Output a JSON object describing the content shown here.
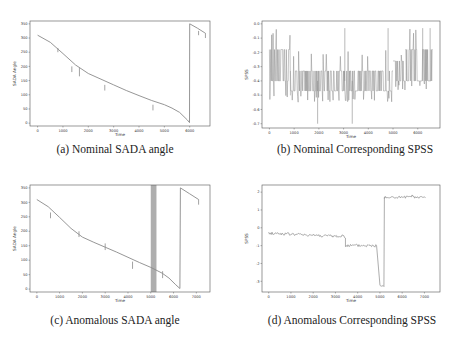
{
  "figure": {
    "panels": [
      {
        "id": "a",
        "caption": "(a) Nominal SADA angle"
      },
      {
        "id": "b",
        "caption": "(b) Nominal Corresponding SPSS"
      },
      {
        "id": "c",
        "caption": "(c) Anomalous SADA angle"
      },
      {
        "id": "d",
        "caption": "(d) Anomalous Corresponding SPSS"
      }
    ]
  },
  "chart_data": [
    {
      "id": "a",
      "type": "line",
      "title": "(a) Nominal SADA angle",
      "xlabel": "Time",
      "ylabel": "SADA Angle",
      "xticks": [
        0,
        1000,
        2000,
        3000,
        4000,
        5000,
        6000
      ],
      "yticks": [
        0,
        50,
        100,
        150,
        200,
        250,
        300,
        350
      ],
      "xlim": [
        -300,
        6800
      ],
      "ylim": [
        -10,
        360
      ],
      "line_color": "#8a8a8a",
      "x": [
        0,
        500,
        1000,
        1500,
        2000,
        2500,
        3000,
        3500,
        4000,
        4500,
        5000,
        5300,
        5600,
        5900,
        5990,
        6000,
        6300,
        6600
      ],
      "y": [
        310,
        285,
        245,
        205,
        175,
        155,
        135,
        115,
        97,
        80,
        65,
        53,
        38,
        12,
        2,
        350,
        335,
        318
      ],
      "spikes": [
        {
          "x": 800,
          "y_from": 250,
          "y_to": 265
        },
        {
          "x": 1350,
          "y_from": 180,
          "y_to": 200
        },
        {
          "x": 1650,
          "y_from": 165,
          "y_to": 195
        },
        {
          "x": 2650,
          "y_from": 115,
          "y_to": 135
        },
        {
          "x": 4550,
          "y_from": 45,
          "y_to": 65
        },
        {
          "x": 6350,
          "y_from": 310,
          "y_to": 325
        },
        {
          "x": 6620,
          "y_from": 300,
          "y_to": 318
        }
      ],
      "grid": false
    },
    {
      "id": "b",
      "type": "line",
      "title": "(b) Nominal Corresponding SPSS",
      "xlabel": "Time",
      "ylabel": "SPSS",
      "xticks": [
        0,
        1000,
        2000,
        3000,
        4000,
        5000,
        6000
      ],
      "yticks": [
        0.0,
        -0.1,
        -0.2,
        -0.3,
        -0.4,
        -0.5,
        -0.6,
        -0.7
      ],
      "xlim": [
        -300,
        6900
      ],
      "ylim": [
        -0.73,
        0.02
      ],
      "line_color": "#8a8a8a",
      "segments": [
        {
          "x_start": 0,
          "x_end": 850,
          "band_low": -0.4,
          "band_high": -0.18,
          "spike_low": -0.55,
          "spike_high": -0.03
        },
        {
          "x_start": 850,
          "x_end": 5000,
          "band_low": -0.47,
          "band_high": -0.33,
          "spike_low": -0.55,
          "spike_high": -0.18
        },
        {
          "x_start": 5000,
          "x_end": 5500,
          "band_low": -0.4,
          "band_high": -0.26,
          "spike_low": -0.47,
          "spike_high": -0.18
        },
        {
          "x_start": 5500,
          "x_end": 6600,
          "band_low": -0.4,
          "band_high": -0.18,
          "spike_low": -0.47,
          "spike_high": -0.03
        }
      ],
      "outliers": [
        {
          "x": 1950,
          "y": -0.7
        },
        {
          "x": 3050,
          "y": -0.03
        },
        {
          "x": 3350,
          "y": -0.7
        },
        {
          "x": 4800,
          "y": -0.03
        },
        {
          "x": 6200,
          "y": -0.03
        },
        {
          "x": 6500,
          "y": -0.03
        }
      ],
      "grid": false
    },
    {
      "id": "c",
      "type": "line",
      "title": "(c) Anomalous SADA angle",
      "xlabel": "Time",
      "ylabel": "SADA Angle",
      "xticks": [
        0,
        1000,
        2000,
        3000,
        4000,
        5000,
        6000,
        7000
      ],
      "yticks": [
        0,
        50,
        100,
        150,
        200,
        250,
        300,
        350
      ],
      "xlim": [
        -300,
        7600
      ],
      "ylim": [
        -10,
        360
      ],
      "line_color": "#8a8a8a",
      "x": [
        0,
        500,
        1000,
        1500,
        2000,
        2500,
        3000,
        3500,
        4000,
        4500,
        5000,
        5500,
        5800,
        6100,
        6280,
        6300,
        6700,
        7100
      ],
      "y": [
        310,
        285,
        248,
        210,
        180,
        162,
        145,
        128,
        110,
        92,
        75,
        55,
        38,
        15,
        2,
        350,
        330,
        310
      ],
      "spikes": [
        {
          "x": 600,
          "y_from": 245,
          "y_to": 265
        },
        {
          "x": 1850,
          "y_from": 180,
          "y_to": 200
        },
        {
          "x": 3000,
          "y_from": 135,
          "y_to": 158
        },
        {
          "x": 4200,
          "y_from": 70,
          "y_to": 95
        },
        {
          "x": 5520,
          "y_from": 38,
          "y_to": 62
        },
        {
          "x": 7100,
          "y_from": 292,
          "y_to": 310
        }
      ],
      "anomaly_region": {
        "x_start": 5000,
        "x_end": 5250,
        "color": "#a0a0a0"
      },
      "grid": false
    },
    {
      "id": "d",
      "type": "line",
      "title": "(d) Anomalous Corresponding SPSS",
      "xlabel": "Time",
      "ylabel": "SPSS",
      "xticks": [
        0,
        1000,
        2000,
        3000,
        4000,
        5000,
        6000,
        7000
      ],
      "yticks": [
        2,
        1,
        0,
        -1,
        -2,
        -3
      ],
      "xlim": [
        -300,
        7700
      ],
      "ylim": [
        -3.6,
        2.4
      ],
      "line_color": "#8a8a8a",
      "levels": [
        {
          "x_start": 0,
          "x_end": 3450,
          "y_start": -0.3,
          "y_end": -0.5,
          "noise": 0.08
        },
        {
          "x_start": 3450,
          "x_end": 4850,
          "y_start": -1.0,
          "y_end": -1.0,
          "noise": 0.08
        },
        {
          "x_start": 4850,
          "x_end": 5000,
          "y_start": -1.0,
          "y_end": -3.2,
          "noise": 0.0
        },
        {
          "x_start": 5000,
          "x_end": 5180,
          "y_start": -3.25,
          "y_end": -3.25,
          "noise": 0.05
        },
        {
          "x_start": 5180,
          "x_end": 5200,
          "y_start": -3.25,
          "y_end": 1.7,
          "noise": 0.0
        },
        {
          "x_start": 5200,
          "x_end": 7050,
          "y_start": 1.7,
          "y_end": 1.7,
          "noise": 0.08
        }
      ],
      "grid": false
    }
  ]
}
